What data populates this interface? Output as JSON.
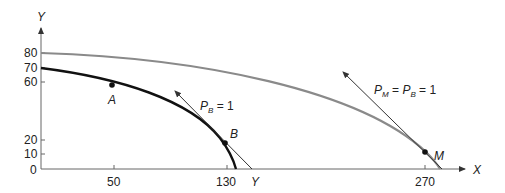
{
  "diagram": {
    "type": "production-possibility-frontier",
    "axes": {
      "x_label": "X",
      "y_label": "Y",
      "x_ticks": [
        "50",
        "130",
        "270"
      ],
      "y_ticks": [
        "80",
        "70",
        "60",
        "20",
        "10",
        "0"
      ],
      "x_extra_label": "Y"
    },
    "points": [
      {
        "name": "A",
        "x": 50,
        "y": 58
      },
      {
        "name": "B",
        "x": 130,
        "y": 18
      },
      {
        "name": "M",
        "x": 270,
        "y": 12
      }
    ],
    "curves": [
      {
        "name": "inner-frontier",
        "color": "#111111",
        "y_intercept": 70,
        "x_intercept": 137
      },
      {
        "name": "outer-frontier",
        "color": "#888888",
        "y_intercept": 80,
        "x_intercept": 285
      }
    ],
    "price_lines": [
      {
        "label_parts": [
          "P",
          "B",
          " = 1"
        ]
      },
      {
        "label_parts": [
          "P",
          "M",
          " = ",
          "P",
          "B",
          " = 1"
        ]
      }
    ]
  }
}
